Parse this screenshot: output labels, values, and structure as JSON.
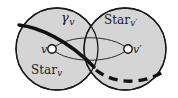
{
  "figure": {
    "type": "diagram",
    "caption_labels": {
      "gamma_v": "γ",
      "gamma_v_sub": "v",
      "star_v": "Star",
      "star_v_sub": "v",
      "star_vprime": "Star",
      "star_vprime_sub": "v′",
      "vertex_v": "v",
      "vertex_vprime": "v′"
    },
    "colors": {
      "disc_fill": "#d5d5d5",
      "disc_stroke": "#1a1a1a",
      "curve_stroke": "#111111",
      "vertex_fill": "#ffffff",
      "vertex_stroke": "#111111",
      "background": "#ffffff",
      "text": "#1a1a1a"
    },
    "elements": {
      "left_disc": {
        "cx": 57,
        "cy": 49,
        "r": 41
      },
      "right_disc": {
        "cx": 125,
        "cy": 49,
        "r": 41
      },
      "vertex_v": {
        "cx": 52,
        "cy": 49,
        "r": 4.2
      },
      "vertex_vprime": {
        "cx": 128,
        "cy": 49,
        "r": 4.2
      },
      "bigon_top": "thin arc from v to v' bulging upward",
      "bigon_bottom": "thin arc from v to v' bulging downward",
      "gamma_curve": "thick solid curve entering upper-left of Star_v and descending to the overlap lens",
      "dashed_curve": "thick dashed curve continuing from the lens to the lower-right of Star_v'"
    }
  }
}
